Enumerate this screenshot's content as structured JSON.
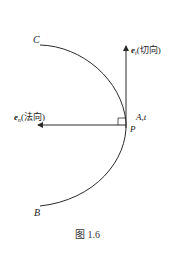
{
  "figure": {
    "caption": "图 1.6",
    "stroke_color": "#2a2a2a",
    "points": {
      "C": {
        "label": "C"
      },
      "B": {
        "label": "B"
      },
      "P": {
        "label": "P"
      },
      "A": {
        "label": "A,t"
      }
    },
    "vectors": {
      "tangent": {
        "symbol": "e",
        "subscript": "t",
        "desc": "(切向)",
        "direction": "up"
      },
      "normal": {
        "symbol": "e",
        "subscript": "n",
        "desc": "(法向)",
        "direction": "left"
      }
    },
    "right_angle_marker": true
  }
}
